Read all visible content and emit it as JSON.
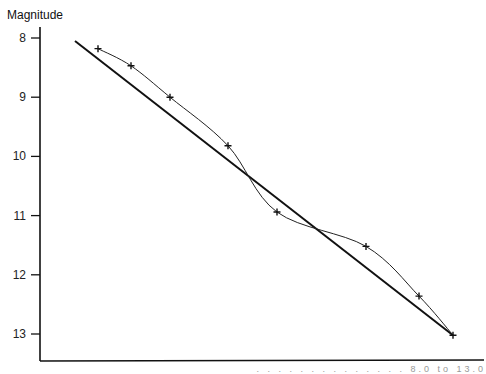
{
  "chart_data": {
    "type": "line",
    "title": "",
    "xlabel": "",
    "ylabel": "Magnitude",
    "y_ticks": [
      8,
      9,
      10,
      11,
      12,
      13
    ],
    "ylim": [
      7.6,
      13.45
    ],
    "y_inverted": true,
    "x_ticks": [],
    "grid": false,
    "legend": null,
    "series": [
      {
        "name": "observed points",
        "style": "crosses joined by thin curved line",
        "x_px": [
          98,
          131,
          170,
          228,
          277,
          366,
          419,
          453
        ],
        "values": [
          8.18,
          8.47,
          9.0,
          9.82,
          10.94,
          11.52,
          12.36,
          13.02
        ]
      },
      {
        "name": "linear fit",
        "style": "thick straight line",
        "x_px": [
          75,
          453
        ],
        "values": [
          8.05,
          13.02
        ]
      }
    ],
    "annotations": [
      "...ude range ... 8.0 to 13.0 (caption partially cut off)"
    ]
  },
  "labels": {
    "y_axis_title": "Magnitude",
    "caption_fragment": ". . .   . .   . .     . .  . .        . . .  8.0  to  13.0"
  }
}
